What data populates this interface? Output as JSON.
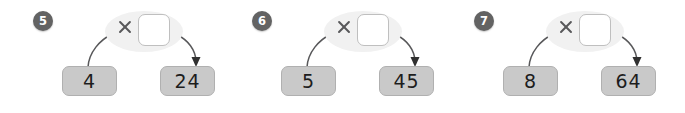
{
  "worksheet": {
    "title": "Multiplication function machine worksheet",
    "operator_symbol": "×",
    "colors": {
      "badge_fill": "#636363",
      "badge_text": "#ffffff",
      "value_box_fill": "#c9c9c9",
      "value_box_border": "#b0b0b0",
      "oval_fill": "#f1f1f1",
      "blank_box_fill": "#ffffff",
      "blank_box_border": "#bfbfbf",
      "arrow_stroke": "#58585a",
      "text": "#1d1d1d",
      "page_background": "#ffffff"
    },
    "problems": [
      {
        "number": "5",
        "operator": "×",
        "factor_value": "",
        "input": "4",
        "output": "24"
      },
      {
        "number": "6",
        "operator": "×",
        "factor_value": "",
        "input": "5",
        "output": "45"
      },
      {
        "number": "7",
        "operator": "×",
        "factor_value": "",
        "input": "8",
        "output": "64"
      }
    ]
  }
}
